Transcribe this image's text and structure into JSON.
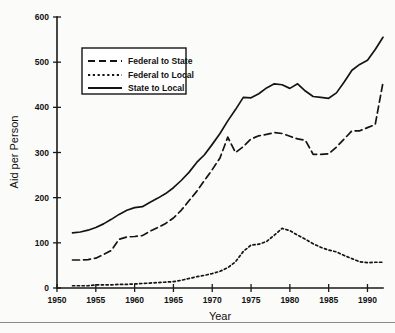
{
  "chart_data": {
    "type": "line",
    "title": "",
    "xlabel": "Year",
    "ylabel": "Aid per Person",
    "xlim": [
      1950,
      1992
    ],
    "ylim": [
      0,
      600
    ],
    "xticks": [
      1950,
      1955,
      1960,
      1965,
      1970,
      1975,
      1980,
      1985,
      1990
    ],
    "yticks": [
      0,
      100,
      200,
      300,
      400,
      500,
      600
    ],
    "grid": false,
    "legend_position": "upper-left",
    "x": [
      1952,
      1953,
      1954,
      1955,
      1956,
      1957,
      1958,
      1959,
      1960,
      1961,
      1962,
      1963,
      1964,
      1965,
      1966,
      1967,
      1968,
      1969,
      1970,
      1971,
      1972,
      1973,
      1974,
      1975,
      1976,
      1977,
      1978,
      1979,
      1980,
      1981,
      1982,
      1983,
      1984,
      1985,
      1986,
      1987,
      1988,
      1989,
      1990,
      1991,
      1992
    ],
    "series": [
      {
        "name": "Federal to State",
        "style": "dashed",
        "values": [
          62,
          62,
          63,
          66,
          74,
          83,
          108,
          113,
          114,
          116,
          126,
          134,
          143,
          155,
          172,
          193,
          214,
          238,
          262,
          288,
          334,
          300,
          313,
          330,
          337,
          340,
          344,
          342,
          336,
          330,
          327,
          296,
          296,
          297,
          312,
          330,
          348,
          348,
          355,
          362,
          455
        ]
      },
      {
        "name": "Federal to Local",
        "style": "dotted",
        "values": [
          5,
          5,
          5,
          7,
          7,
          7,
          8,
          8,
          9,
          10,
          11,
          12,
          13,
          14,
          17,
          21,
          25,
          28,
          32,
          37,
          45,
          58,
          81,
          95,
          97,
          103,
          117,
          132,
          127,
          117,
          108,
          98,
          90,
          84,
          80,
          72,
          65,
          58,
          56,
          57,
          57
        ]
      },
      {
        "name": "State to Local",
        "style": "solid",
        "values": [
          122,
          124,
          128,
          134,
          142,
          152,
          163,
          172,
          178,
          180,
          190,
          199,
          209,
          222,
          238,
          256,
          278,
          295,
          318,
          342,
          370,
          395,
          422,
          421,
          430,
          443,
          452,
          450,
          442,
          452,
          436,
          424,
          422,
          420,
          432,
          456,
          482,
          495,
          504,
          528,
          555
        ]
      }
    ]
  },
  "legend": {
    "items": [
      {
        "label": "Federal to State",
        "style": "dashed"
      },
      {
        "label": "Federal to Local",
        "style": "dotted"
      },
      {
        "label": "State to Local",
        "style": "solid"
      }
    ]
  }
}
